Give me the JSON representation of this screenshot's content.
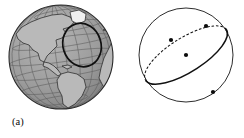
{
  "figure": {
    "type": "two-panel-geometry-illustration",
    "panels": [
      {
        "id": "a",
        "caption": "(a)",
        "subject": "globe",
        "description": "Shaded globe of the Earth showing the Americas with latitude and longitude graticule, and a bold circle outlined over the North Atlantic region",
        "globe": {
          "center_x": 61,
          "center_y": 57,
          "radius": 52,
          "fill_color": "#9b9b9b",
          "land_color": "#b4b4b4",
          "outline_color": "#2a2a2a",
          "graticule_color": "#575757",
          "highlight_circle": {
            "center_x": 82,
            "center_y": 45,
            "radius_x": 19,
            "radius_y": 22,
            "rotation_deg": -18,
            "stroke_color": "#111111",
            "stroke_width": 1.6
          }
        }
      },
      {
        "id": "b",
        "caption": "(b)",
        "subject": "sphere-with-great-circle",
        "description": "Sphere with center O and a great circle whose near half is drawn solid and far half dashed, with marked points A and B",
        "sphere": {
          "center_x": 64,
          "center_y": 55,
          "radius": 47,
          "stroke_color": "#222222",
          "stroke_width": 0.9,
          "fill_color": "#ffffff"
        },
        "great_circle": {
          "rotation_deg": -32,
          "semi_major": 47,
          "semi_minor": 17,
          "solid_stroke_color": "#111111",
          "solid_stroke_width": 1.5,
          "dashed_stroke_color": "#111111",
          "dashed_pattern": "1.8 2.6"
        },
        "points": [
          {
            "name": "A",
            "label": "A",
            "x": 49,
            "y": 40,
            "radius": 2.1,
            "on_arc": "solid"
          },
          {
            "name": "B",
            "label": "B",
            "x": 91,
            "y": 92,
            "radius": 2.1,
            "on_arc": "solid"
          },
          {
            "name": "O",
            "label": "O",
            "x": 64,
            "y": 55,
            "radius": 2.1,
            "on_arc": "center"
          },
          {
            "name": "back-point",
            "label": "",
            "x": 84,
            "y": 26,
            "radius": 2.1,
            "on_arc": "dashed"
          }
        ],
        "labels": {
          "A": "A",
          "B": "B",
          "O": "O"
        }
      }
    ]
  },
  "colors": {
    "background": "#ffffff",
    "ink": "#0b0b0b",
    "globe_ocean": "#9b9b9b",
    "globe_land": "#b4b4b4"
  }
}
